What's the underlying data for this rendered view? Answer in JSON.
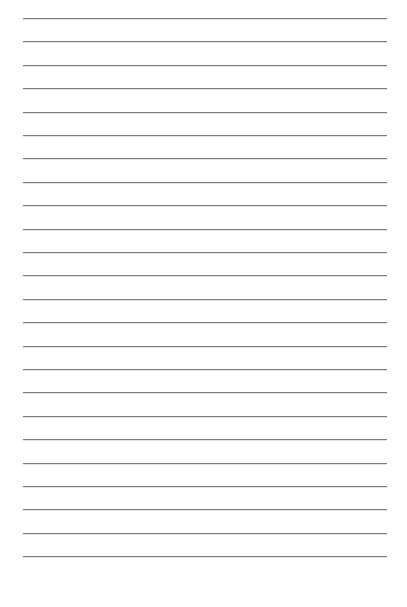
{
  "page": {
    "type": "lined-paper",
    "background_color": "#ffffff",
    "rule_color": "#7d7d7d",
    "rule_count": 24,
    "first_rule_y": 18,
    "rule_spacing": 23.4,
    "rule_left": 23,
    "rule_right": 387,
    "text": ""
  }
}
